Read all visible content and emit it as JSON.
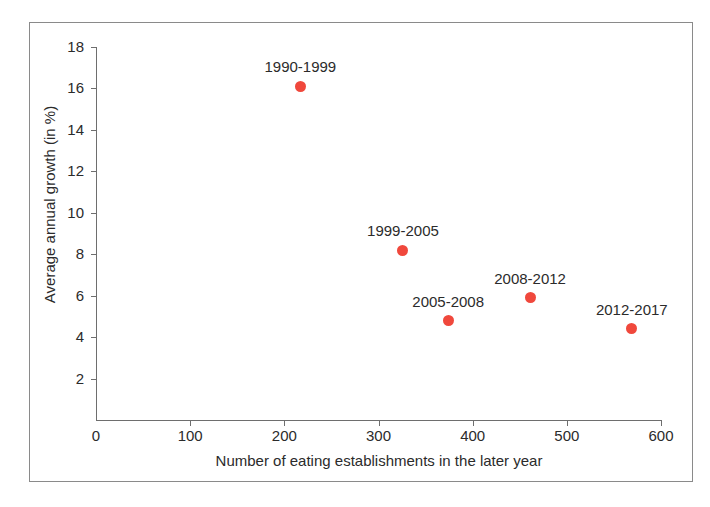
{
  "chart_data": {
    "type": "scatter",
    "title": "",
    "xlabel": "Number of eating establishments in the later year",
    "ylabel": "Average annual growth (in %)",
    "xlim": [
      0,
      600
    ],
    "ylim": [
      0,
      18
    ],
    "xticks": [
      "0",
      "100",
      "200",
      "300",
      "400",
      "500",
      "600"
    ],
    "xtick_values": [
      0,
      100,
      200,
      300,
      400,
      500,
      600
    ],
    "yticks": [
      "2",
      "4",
      "6",
      "8",
      "10",
      "12",
      "14",
      "16",
      "18"
    ],
    "ytick_values": [
      2,
      4,
      6,
      8,
      10,
      12,
      14,
      16,
      18
    ],
    "grid": false,
    "legend": "none",
    "marker_color": "#f0483c",
    "points": [
      {
        "label": "1990-1999",
        "x": 217,
        "y": 16.1
      },
      {
        "label": "1999-2005",
        "x": 326,
        "y": 8.2
      },
      {
        "label": "2005-2008",
        "x": 374,
        "y": 4.8
      },
      {
        "label": "2008-2012",
        "x": 461,
        "y": 5.9
      },
      {
        "label": "2012-2017",
        "x": 569,
        "y": 4.4
      }
    ]
  },
  "axes": {
    "x_origin_label": "0"
  }
}
